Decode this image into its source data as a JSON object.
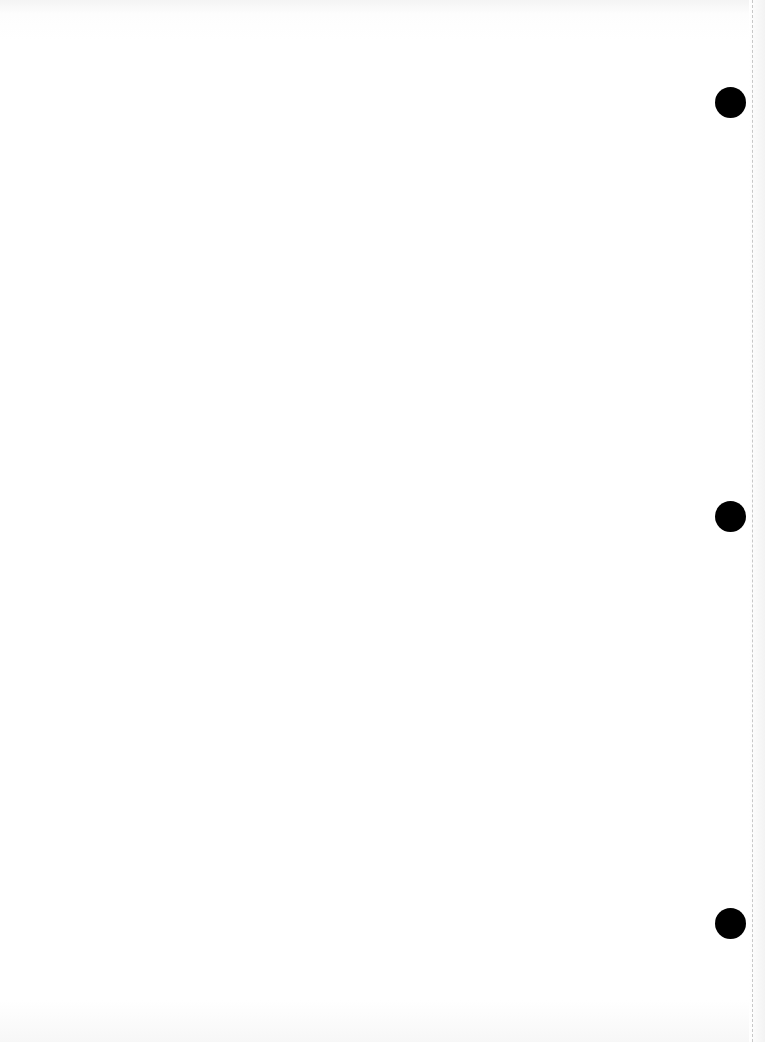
{
  "document": {
    "type": "blank scanned page",
    "text": "",
    "punch_holes": [
      {
        "name": "top",
        "cx": 730,
        "cy": 102,
        "r": 15
      },
      {
        "name": "middle",
        "cx": 731,
        "cy": 516,
        "r": 15
      },
      {
        "name": "bottom",
        "cx": 731,
        "cy": 923,
        "r": 15
      }
    ],
    "colors": {
      "paper": "#ffffff",
      "hole": "#000000",
      "fold_line": "#c8c8c8"
    }
  }
}
